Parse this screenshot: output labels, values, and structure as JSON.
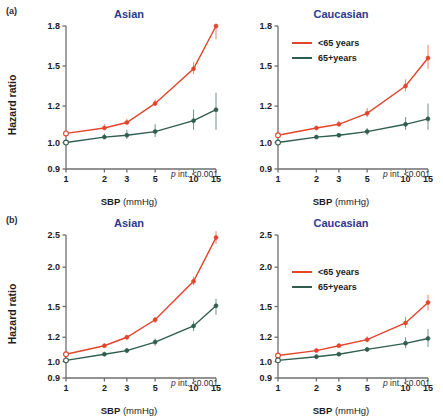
{
  "figure": {
    "panel_rows": [
      {
        "row_label": "(a)"
      },
      {
        "row_label": "(b)"
      }
    ]
  },
  "axis": {
    "xlabel_main": "SBP",
    "xlabel_unit": "(mmHg)",
    "ylabel": "Hazard ratio"
  },
  "legend": {
    "entries": [
      {
        "label": "<65 years",
        "color": "#e2452b"
      },
      {
        "label": "65+years",
        "color": "#2f5d4e"
      }
    ]
  },
  "annotation": {
    "p_italic": "p",
    "p_rest": " int. <0.001"
  },
  "colors": {
    "young": "#e2452b",
    "old": "#2f5d4e",
    "title": "#2b3a8f",
    "axis": "#6e6e6e",
    "text": "#1c1c1c"
  },
  "chart_data": [
    {
      "id": "a-asian",
      "type": "line",
      "title": "Asian",
      "panel": "(a)",
      "xlabel": "SBP (mmHg)",
      "ylabel": "Hazard ratio",
      "xscale": "log",
      "x": [
        1,
        2,
        3,
        5,
        10,
        15
      ],
      "xticklabels": [
        "1",
        "2",
        "3",
        "5",
        "10",
        "15"
      ],
      "yticks": [
        0.9,
        1.0,
        1.2,
        1.5,
        1.8
      ],
      "yticklabels": [
        "0.9",
        "1.0",
        "1.2",
        "1.5",
        "1.8"
      ],
      "ylim": [
        0.9,
        1.8
      ],
      "grid": false,
      "annotation": "p int. <0.001",
      "series": [
        {
          "name": "<65 years",
          "color": "#e2452b",
          "values": [
            1.05,
            1.08,
            1.11,
            1.22,
            1.48,
            1.8
          ],
          "ci_low": [
            1.05,
            1.07,
            1.1,
            1.2,
            1.44,
            1.7
          ],
          "ci_high": [
            1.05,
            1.1,
            1.13,
            1.25,
            1.53,
            1.8
          ]
        },
        {
          "name": "65+years",
          "color": "#2f5d4e",
          "values": [
            1.0,
            1.03,
            1.04,
            1.06,
            1.12,
            1.18
          ],
          "ci_low": [
            1.0,
            1.02,
            1.02,
            1.03,
            1.07,
            1.07
          ],
          "ci_high": [
            1.0,
            1.05,
            1.07,
            1.1,
            1.18,
            1.3
          ]
        }
      ]
    },
    {
      "id": "a-caucasian",
      "type": "line",
      "title": "Caucasian",
      "panel": "(a)",
      "xlabel": "SBP (mmHg)",
      "ylabel": "Hazard ratio",
      "xscale": "log",
      "x": [
        1,
        2,
        3,
        5,
        10,
        15
      ],
      "xticklabels": [
        "1",
        "2",
        "3",
        "5",
        "10",
        "15"
      ],
      "yticks": [
        0.9,
        1.0,
        1.2,
        1.5,
        1.8
      ],
      "yticklabels": [
        "0.9",
        "1.0",
        "1.2",
        "1.5",
        "1.8"
      ],
      "ylim": [
        0.9,
        1.8
      ],
      "grid": false,
      "annotation": "p int. <0.001",
      "series": [
        {
          "name": "<65 years",
          "color": "#e2452b",
          "values": [
            1.04,
            1.08,
            1.1,
            1.16,
            1.35,
            1.56
          ],
          "ci_low": [
            1.04,
            1.07,
            1.09,
            1.14,
            1.31,
            1.48
          ],
          "ci_high": [
            1.04,
            1.09,
            1.12,
            1.19,
            1.4,
            1.66
          ]
        },
        {
          "name": "65+years",
          "color": "#2f5d4e",
          "values": [
            1.0,
            1.03,
            1.04,
            1.06,
            1.1,
            1.13
          ],
          "ci_low": [
            1.0,
            1.02,
            1.03,
            1.04,
            1.07,
            1.07
          ],
          "ci_high": [
            1.0,
            1.04,
            1.05,
            1.08,
            1.14,
            1.22
          ]
        }
      ]
    },
    {
      "id": "b-asian",
      "type": "line",
      "title": "Asian",
      "panel": "(b)",
      "xlabel": "SBP (mmHg)",
      "ylabel": "Hazard ratio",
      "xscale": "log",
      "x": [
        1,
        2,
        3,
        5,
        10,
        15
      ],
      "xticklabels": [
        "1",
        "2",
        "3",
        "5",
        "10",
        "15"
      ],
      "yticks": [
        0.9,
        1.0,
        1.2,
        1.5,
        2.0,
        2.5
      ],
      "yticklabels": [
        "0.9",
        "1.0",
        "1.2",
        "1.5",
        "2.0",
        "2.5"
      ],
      "ylim": [
        0.9,
        2.5
      ],
      "grid": false,
      "annotation": "p int. <0.001",
      "series": [
        {
          "name": "<65 years",
          "color": "#e2452b",
          "values": [
            1.06,
            1.13,
            1.2,
            1.37,
            1.82,
            2.46
          ],
          "ci_low": [
            1.06,
            1.12,
            1.18,
            1.34,
            1.77,
            2.36
          ],
          "ci_high": [
            1.06,
            1.15,
            1.22,
            1.4,
            1.88,
            2.56
          ]
        },
        {
          "name": "65+years",
          "color": "#2f5d4e",
          "values": [
            1.01,
            1.06,
            1.09,
            1.16,
            1.31,
            1.51
          ],
          "ci_low": [
            1.01,
            1.05,
            1.07,
            1.13,
            1.26,
            1.42
          ],
          "ci_high": [
            1.01,
            1.08,
            1.11,
            1.19,
            1.36,
            1.6
          ]
        }
      ]
    },
    {
      "id": "b-caucasian",
      "type": "line",
      "title": "Caucasian",
      "panel": "(b)",
      "xlabel": "SBP (mmHg)",
      "ylabel": "Hazard ratio",
      "xscale": "log",
      "x": [
        1,
        2,
        3,
        5,
        10,
        15
      ],
      "xticklabels": [
        "1",
        "2",
        "3",
        "5",
        "10",
        "15"
      ],
      "yticks": [
        0.9,
        1.0,
        1.2,
        1.5,
        2.0,
        2.5
      ],
      "yticklabels": [
        "0.9",
        "1.0",
        "1.2",
        "1.5",
        "2.0",
        "2.5"
      ],
      "ylim": [
        0.9,
        2.5
      ],
      "grid": false,
      "annotation": "p int. <0.001",
      "series": [
        {
          "name": "<65 years",
          "color": "#e2452b",
          "values": [
            1.05,
            1.09,
            1.13,
            1.18,
            1.34,
            1.55
          ],
          "ci_low": [
            1.05,
            1.08,
            1.12,
            1.16,
            1.29,
            1.46
          ],
          "ci_high": [
            1.05,
            1.11,
            1.15,
            1.21,
            1.4,
            1.65
          ]
        },
        {
          "name": "65+years",
          "color": "#2f5d4e",
          "values": [
            1.01,
            1.04,
            1.06,
            1.1,
            1.15,
            1.19
          ],
          "ci_low": [
            1.01,
            1.03,
            1.05,
            1.08,
            1.11,
            1.12
          ],
          "ci_high": [
            1.01,
            1.06,
            1.08,
            1.12,
            1.2,
            1.28
          ]
        }
      ]
    }
  ]
}
